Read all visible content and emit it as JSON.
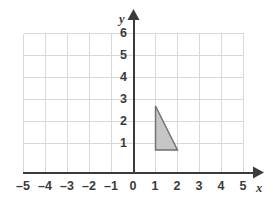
{
  "chart_data": {
    "type": "scatter",
    "title": "",
    "subtitle": "",
    "xlabel": "x",
    "ylabel": "y",
    "xlim": [
      -5,
      5
    ],
    "ylim": [
      0,
      6
    ],
    "grid": true,
    "legend": false,
    "legend_position": "none",
    "x_tick_labels": [
      "–5",
      "–4",
      "–3",
      "–2",
      "–1",
      "0",
      "1",
      "2",
      "3",
      "4",
      "5"
    ],
    "x_tick_values": [
      -5,
      -4,
      -3,
      -2,
      -1,
      0,
      1,
      2,
      3,
      4,
      5
    ],
    "y_tick_labels": [
      "1",
      "2",
      "3",
      "4",
      "5",
      "6"
    ],
    "y_tick_values": [
      1,
      2,
      3,
      4,
      5,
      6
    ],
    "shapes": [
      {
        "name": "triangle",
        "kind": "polygon",
        "vertices": [
          [
            1,
            3
          ],
          [
            1,
            1
          ],
          [
            2,
            1
          ]
        ],
        "fill": "#c6c6c6",
        "stroke": "#6e6e6e",
        "base_length": 1,
        "height": 2,
        "area": 1
      }
    ],
    "annotations": [],
    "series": []
  },
  "style": {
    "background": "#ffffff",
    "grid_color": "#d8d8d8",
    "axis_color": "#3b3b3b",
    "label_color": "#3b3b3b",
    "shape_fill": "#c6c6c6",
    "shape_stroke": "#6e6e6e"
  },
  "geometry": {
    "origin_x": 133,
    "origin_y": 172,
    "unit": 22,
    "grid_left": 23,
    "grid_right": 243,
    "grid_top": 33,
    "grid_bottom": 172
  }
}
